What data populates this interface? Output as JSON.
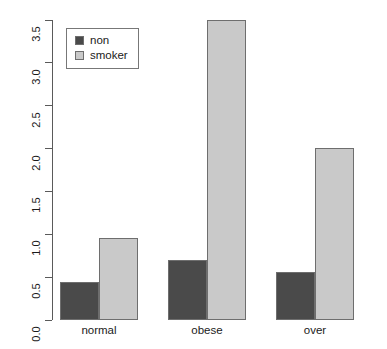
{
  "chart_data": {
    "type": "bar",
    "title": "",
    "subtitle": "",
    "xlabel": "",
    "ylabel": "",
    "grid": false,
    "orientation": "vertical",
    "grouping": "grouped",
    "legend_position": "top-left",
    "categories": [
      "normal",
      "obese",
      "over"
    ],
    "series": [
      {
        "name": "non",
        "color": "#4a4a4a",
        "values": [
          0.44,
          0.7,
          0.56
        ]
      },
      {
        "name": "smoker",
        "color": "#c9c9c9",
        "values": [
          0.96,
          3.5,
          2.01
        ]
      }
    ],
    "ylim": [
      0.0,
      3.5
    ],
    "ytick_values": [
      0.0,
      0.5,
      1.0,
      1.5,
      2.0,
      2.5,
      3.0,
      3.5
    ],
    "ytick_labels": [
      "0.0",
      "0.5",
      "1.0",
      "1.5",
      "2.0",
      "2.5",
      "3.0",
      "3.5"
    ],
    "xtick_labels": [
      "normal",
      "obese",
      "over"
    ],
    "annotations": []
  },
  "legend": {
    "entries": [
      {
        "label": "non"
      },
      {
        "label": "smoker"
      }
    ]
  },
  "axis": {
    "y_tick_labels": [
      "0.0",
      "0.5",
      "1.0",
      "1.5",
      "2.0",
      "2.5",
      "3.0",
      "3.5"
    ],
    "x_tick_labels": [
      "normal",
      "obese",
      "over"
    ]
  },
  "colors": {
    "series_non": "#4a4a4a",
    "series_smoker": "#c9c9c9",
    "axis": "#5a5a5a",
    "bar_border": "#6e6e6e",
    "text": "#1a1a1a",
    "background": "#ffffff"
  },
  "geometry": {
    "y_axis_top_px": 20,
    "y_axis_bottom_px": 320,
    "bar_width_px": 39,
    "group_centers_px": [
      99,
      207,
      315
    ]
  }
}
